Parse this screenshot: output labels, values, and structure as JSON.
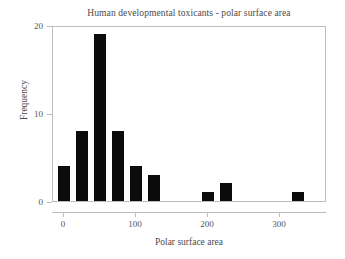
{
  "chart_data": {
    "type": "bar",
    "title": "Human developmental toxicants - polar surface area",
    "xlabel": "Polar surface area",
    "ylabel": "Frequency",
    "bin_width": 25,
    "x": [
      0,
      25,
      50,
      75,
      100,
      125,
      200,
      225,
      325
    ],
    "values": [
      4,
      8,
      19,
      8,
      4,
      3,
      1,
      2,
      1
    ],
    "categories": [
      "0",
      "25",
      "50",
      "75",
      "100",
      "125",
      "200",
      "225",
      "325"
    ],
    "xlim": [
      -15,
      365
    ],
    "ylim": [
      0,
      20
    ],
    "xticks": [
      0,
      100,
      200,
      300
    ],
    "xtick_labels": [
      "0",
      "100",
      "200",
      "300"
    ],
    "yticks": [
      0,
      10,
      20
    ],
    "ytick_labels": [
      "0",
      "10",
      "20"
    ],
    "grid": false,
    "legend": false,
    "bar_color": "#0b0b0b",
    "frame_color": "#bdbdbd",
    "background": "#ffffff"
  }
}
